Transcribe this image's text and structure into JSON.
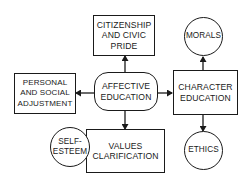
{
  "diagram": {
    "type": "concept-map",
    "center": {
      "id": "affective",
      "label": "AFFECTIVE\nEDUCATION",
      "shape": "rounded-rect"
    },
    "nodes": [
      {
        "id": "citizenship",
        "label": "CITIZENSHIP\nAND CIVIC\nPRIDE",
        "shape": "rect"
      },
      {
        "id": "personal",
        "label": "PERSONAL\nAND SOCIAL\nADJUSTMENT",
        "shape": "rect"
      },
      {
        "id": "affective",
        "label": "AFFECTIVE\nEDUCATION",
        "shape": "rounded-rect"
      },
      {
        "id": "character",
        "label": "CHARACTER\nEDUCATION",
        "shape": "rect"
      },
      {
        "id": "morals",
        "label": "MORALS",
        "shape": "circle"
      },
      {
        "id": "ethics",
        "label": "ETHICS",
        "shape": "circle"
      },
      {
        "id": "values",
        "label": "VALUES\nCLARIFICATION",
        "shape": "rect"
      },
      {
        "id": "selfesteem",
        "label": "SELF-\nESTEEM",
        "shape": "circle"
      }
    ],
    "edges": [
      {
        "from": "affective",
        "to": "citizenship",
        "arrow": "up"
      },
      {
        "from": "affective",
        "to": "personal",
        "arrow": "left"
      },
      {
        "from": "affective",
        "to": "character",
        "arrow": "right"
      },
      {
        "from": "affective",
        "to": "values",
        "arrow": "down"
      },
      {
        "from": "character",
        "to": "morals",
        "arrow": "up"
      },
      {
        "from": "character",
        "to": "ethics",
        "arrow": "down"
      }
    ],
    "colors": {
      "stroke": "#1a1a1a",
      "fill": "#ffffff"
    }
  }
}
